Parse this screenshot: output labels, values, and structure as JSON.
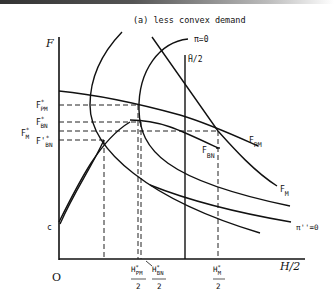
{
  "figure": {
    "title": "(a) less convex demand",
    "y_axis_label": "F",
    "x_axis_label": "H/2",
    "origin_label": "O",
    "c_label": "c",
    "y_ticks": {
      "fpm_main": "F",
      "fpm_sup": "*",
      "fpm_sub": "PM",
      "fbn_main": "F",
      "fbn_sup": "*",
      "fbn_sub": "BN",
      "fm_main": "F",
      "fm_sup": "*",
      "fm_sub": "M",
      "fbn2_main": "F'",
      "fbn2_sup": "*",
      "fbn2_sub": "BN"
    },
    "x_ticks": {
      "hpm_num": "H",
      "hpm_sup": "*",
      "hpm_sub": "PM",
      "hpm_den": "2",
      "hbn_num": "H",
      "hbn_sup": "*",
      "hbn_sub": "BN",
      "hbn_den": "2",
      "hm_num": "H",
      "hm_sup": "*",
      "hm_sub": "M",
      "hm_den": "2"
    },
    "curve_labels": {
      "pi0": "π=0",
      "hbar": "H̄/2",
      "fpm_main": "F",
      "fpm_sub": "PM",
      "fbn_main": "F",
      "fbn_sub": "BN",
      "fm_main": "F",
      "fm_sub": "M",
      "pi2": "π''=0"
    }
  }
}
